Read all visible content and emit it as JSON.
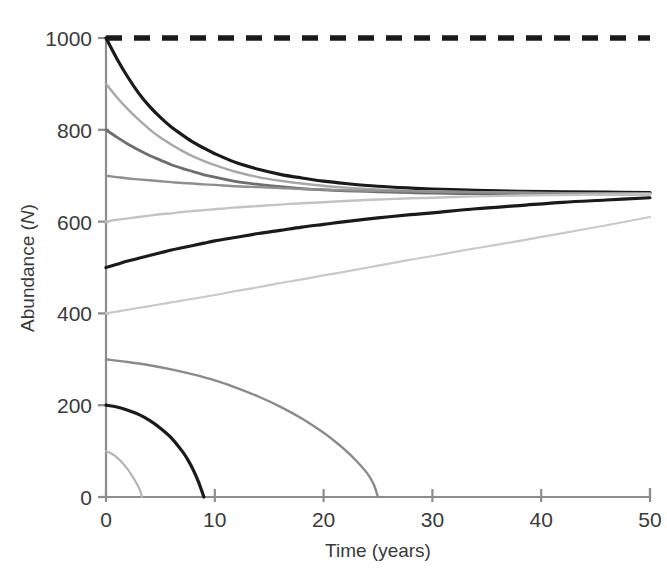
{
  "chart_data": {
    "type": "line",
    "title": "",
    "xlabel": "Time (years)",
    "ylabel": "Abundance (N)",
    "ylabel_plain": "Abundance",
    "ylabel_symbol": "N",
    "xlim": [
      0,
      50
    ],
    "ylim": [
      0,
      1000
    ],
    "xticks": [
      0,
      10,
      20,
      30,
      40,
      50
    ],
    "yticks": [
      0,
      200,
      400,
      600,
      800,
      1000
    ],
    "xtick_labels": [
      "0",
      "10",
      "20",
      "30",
      "40",
      "50"
    ],
    "ytick_labels": [
      "0",
      "200",
      "400",
      "600",
      "800",
      "1000"
    ],
    "grid": false,
    "legend": "none",
    "annotations": [
      {
        "name": "carrying-capacity-line",
        "description": "horizontal dashed reference line at N = 1000",
        "value": 1000,
        "style": "dashed",
        "color": "#1a1a1a"
      }
    ],
    "equilibrium_value": 662,
    "series": [
      {
        "name": "N0 = 1000",
        "initial": 1000,
        "color": "#1a1a1a",
        "width": 3.2,
        "fate": "converges",
        "x": [
          0,
          1,
          2,
          3,
          4,
          5,
          6,
          7,
          8,
          9,
          10,
          12,
          14,
          16,
          18,
          20,
          22,
          25,
          28,
          30,
          34,
          38,
          42,
          46,
          50
        ],
        "y": [
          1000,
          955,
          915,
          880,
          851,
          827,
          806,
          789,
          773,
          760,
          748,
          728,
          714,
          703,
          695,
          688,
          683,
          677,
          673,
          671,
          668,
          666,
          665,
          664,
          663
        ]
      },
      {
        "name": "N0 = 900",
        "initial": 900,
        "color": "#a8a8a8",
        "width": 2.4,
        "fate": "converges",
        "x": [
          0,
          1,
          2,
          3,
          4,
          5,
          6,
          7,
          8,
          9,
          10,
          12,
          14,
          16,
          18,
          20,
          22,
          25,
          28,
          30,
          34,
          38,
          42,
          46,
          50
        ],
        "y": [
          900,
          871,
          845,
          822,
          801,
          783,
          768,
          754,
          742,
          732,
          723,
          708,
          697,
          689,
          683,
          678,
          674,
          670,
          667,
          666,
          664,
          663,
          662,
          662,
          661
        ]
      },
      {
        "name": "N0 = 800",
        "initial": 800,
        "color": "#6e6e6e",
        "width": 2.8,
        "fate": "converges",
        "x": [
          0,
          1,
          2,
          3,
          4,
          5,
          6,
          7,
          8,
          9,
          10,
          12,
          14,
          16,
          18,
          20,
          22,
          25,
          28,
          30,
          34,
          38,
          42,
          46,
          50
        ],
        "y": [
          800,
          784,
          769,
          756,
          744,
          734,
          724,
          716,
          709,
          702,
          697,
          687,
          681,
          676,
          672,
          669,
          667,
          665,
          663,
          662,
          661,
          661,
          660,
          660,
          660
        ]
      },
      {
        "name": "N0 = 700",
        "initial": 700,
        "color": "#8f8f8f",
        "width": 2.4,
        "fate": "converges",
        "x": [
          0,
          1,
          2,
          3,
          4,
          5,
          6,
          7,
          8,
          9,
          10,
          12,
          14,
          16,
          18,
          20,
          22,
          25,
          28,
          30,
          34,
          38,
          42,
          46,
          50
        ],
        "y": [
          700,
          697,
          694,
          692,
          690,
          688,
          686,
          684,
          683,
          681,
          680,
          677,
          675,
          673,
          671,
          670,
          668,
          667,
          666,
          665,
          664,
          663,
          662,
          662,
          661
        ]
      },
      {
        "name": "N0 = 600",
        "initial": 600,
        "color": "#c3c3c3",
        "width": 2.4,
        "fate": "converges",
        "x": [
          0,
          1,
          2,
          3,
          4,
          5,
          6,
          7,
          8,
          9,
          10,
          12,
          14,
          16,
          18,
          20,
          22,
          25,
          28,
          30,
          34,
          38,
          42,
          46,
          50
        ],
        "y": [
          600,
          604,
          607,
          610,
          613,
          616,
          618,
          621,
          623,
          625,
          627,
          631,
          634,
          637,
          640,
          642,
          645,
          648,
          651,
          652,
          655,
          657,
          658,
          659,
          660
        ]
      },
      {
        "name": "N0 = 500",
        "initial": 500,
        "color": "#1a1a1a",
        "width": 3.2,
        "fate": "converges",
        "x": [
          0,
          1,
          2,
          3,
          4,
          5,
          6,
          7,
          8,
          9,
          10,
          12,
          14,
          16,
          18,
          20,
          22,
          25,
          28,
          30,
          34,
          38,
          42,
          46,
          50
        ],
        "y": [
          500,
          507,
          514,
          520,
          526,
          532,
          538,
          543,
          548,
          553,
          558,
          566,
          574,
          581,
          588,
          594,
          600,
          608,
          615,
          619,
          628,
          635,
          642,
          647,
          652
        ]
      },
      {
        "name": "N0 = 400",
        "initial": 400,
        "color": "#c9c9c9",
        "width": 2.2,
        "fate": "converges-slowly",
        "x": [
          0,
          2,
          4,
          6,
          8,
          10,
          12,
          14,
          16,
          18,
          20,
          22,
          25,
          28,
          30,
          34,
          38,
          42,
          46,
          50
        ],
        "y": [
          400,
          408,
          416,
          424,
          432,
          440,
          449,
          457,
          466,
          474,
          483,
          491,
          504,
          517,
          525,
          542,
          558,
          575,
          592,
          610
        ]
      },
      {
        "name": "N0 = 300",
        "initial": 300,
        "color": "#8a8a8a",
        "width": 2.4,
        "fate": "extinct",
        "extinction_time": 25,
        "x": [
          0,
          2,
          4,
          6,
          8,
          10,
          12,
          14,
          16,
          18,
          20,
          21,
          22,
          23,
          24,
          24.6,
          25
        ],
        "y": [
          300,
          294,
          287,
          278,
          267,
          254,
          238,
          219,
          197,
          171,
          140,
          122,
          102,
          79,
          52,
          28,
          0
        ]
      },
      {
        "name": "N0 = 200",
        "initial": 200,
        "color": "#1a1a1a",
        "width": 3.2,
        "fate": "extinct",
        "extinction_time": 9,
        "x": [
          0,
          1,
          2,
          3,
          4,
          5,
          6,
          7,
          7.5,
          8,
          8.5,
          9
        ],
        "y": [
          200,
          196,
          189,
          180,
          167,
          150,
          129,
          100,
          82,
          60,
          33,
          0
        ]
      },
      {
        "name": "N0 = 100",
        "initial": 100,
        "color": "#b5b5b5",
        "width": 2.2,
        "fate": "extinct",
        "extinction_time": 3.3,
        "x": [
          0,
          0.4,
          0.8,
          1.2,
          1.6,
          2,
          2.4,
          2.8,
          3.1,
          3.3
        ],
        "y": [
          100,
          96,
          90,
          82,
          72,
          60,
          46,
          30,
          16,
          0
        ]
      }
    ]
  },
  "axes": {
    "x_title": "Time (years)",
    "y_title_prefix": "Abundance (",
    "y_title_symbol": "N",
    "y_title_suffix": ")"
  },
  "colors": {
    "axis": "#8d8d8d",
    "text": "#3a3a3a",
    "dark_series": "#1a1a1a",
    "background": "#ffffff"
  }
}
